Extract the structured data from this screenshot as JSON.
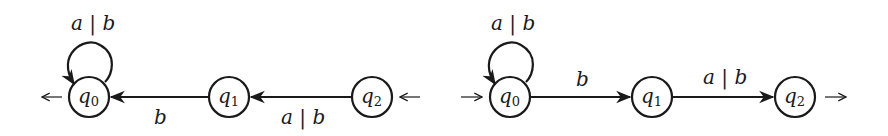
{
  "diagrams": [
    {
      "name": "left-automaton",
      "states": [
        {
          "id": "q0",
          "base": "q",
          "sub": "0",
          "cx": 89,
          "cy": 97
        },
        {
          "id": "q1",
          "base": "q",
          "sub": "1",
          "cx": 229,
          "cy": 97
        },
        {
          "id": "q2",
          "base": "q",
          "sub": "2",
          "cx": 372,
          "cy": 97
        }
      ],
      "loop_label": "a | b",
      "edges": [
        {
          "from": "q1",
          "to": "q0",
          "label": "b"
        },
        {
          "from": "q2",
          "to": "q1",
          "label": "a | b"
        }
      ],
      "initial_state": "q2",
      "final_state": "q0"
    },
    {
      "name": "right-automaton",
      "states": [
        {
          "id": "q0",
          "base": "q",
          "sub": "0",
          "cx": 510,
          "cy": 97
        },
        {
          "id": "q1",
          "base": "q",
          "sub": "1",
          "cx": 652,
          "cy": 97
        },
        {
          "id": "q2",
          "base": "q",
          "sub": "2",
          "cx": 795,
          "cy": 97
        }
      ],
      "loop_label": "a | b",
      "edges": [
        {
          "from": "q0",
          "to": "q1",
          "label": "b"
        },
        {
          "from": "q1",
          "to": "q2",
          "label": "a | b"
        }
      ],
      "initial_state": "q0",
      "final_state": "q2"
    }
  ],
  "labels": {
    "left_loop": "a | b",
    "left_edge_q1_q0": "b",
    "left_edge_q2_q1": "a | b",
    "right_loop": "a | b",
    "right_edge_q0_q1": "b",
    "right_edge_q1_q2": "a | b",
    "state_base": "q",
    "sub0": "0",
    "sub1": "1",
    "sub2": "2"
  }
}
